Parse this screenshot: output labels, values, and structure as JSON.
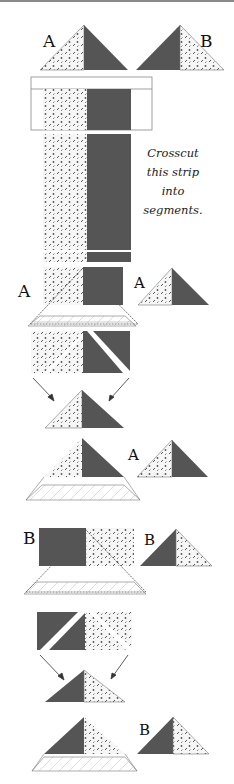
{
  "labels": {
    "a_top": "A",
    "b_top": "B",
    "a_step1_left": "A",
    "a_step1_result": "A",
    "a_step2_result": "A",
    "b_step1_left": "B",
    "b_step1_result": "B",
    "b_step2_result": "B"
  },
  "instruction": {
    "line1": "Crosscut",
    "line2": "this strip",
    "line3": "into",
    "line4": "segments."
  },
  "colors": {
    "dark_fabric": "#555555",
    "print_fabric": "#f4f4f4",
    "print_dots": "#555555",
    "outline": "#777777",
    "ruler_line": "#888888",
    "top_border": "#8a8a8a"
  }
}
